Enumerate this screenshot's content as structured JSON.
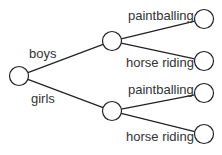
{
  "diagram": {
    "type": "tree-diagram",
    "root": {
      "x": 19,
      "y": 76
    },
    "level1": [
      {
        "label": "boys",
        "x": 112,
        "y": 41,
        "label_x": 29,
        "label_y": 58,
        "children": [
          {
            "label": "paintballing",
            "x": 204,
            "y": 19,
            "label_x": 128,
            "label_y": 20
          },
          {
            "label": "horse riding",
            "x": 204,
            "y": 61,
            "label_x": 126,
            "label_y": 67
          }
        ]
      },
      {
        "label": "girls",
        "x": 112,
        "y": 111,
        "label_x": 31,
        "label_y": 103,
        "children": [
          {
            "label": "paintballing",
            "x": 204,
            "y": 93,
            "label_x": 128,
            "label_y": 94
          },
          {
            "label": "horse riding",
            "x": 204,
            "y": 134,
            "label_x": 126,
            "label_y": 141
          }
        ]
      }
    ],
    "node_radius": 9.5,
    "line_color": "#222222"
  }
}
